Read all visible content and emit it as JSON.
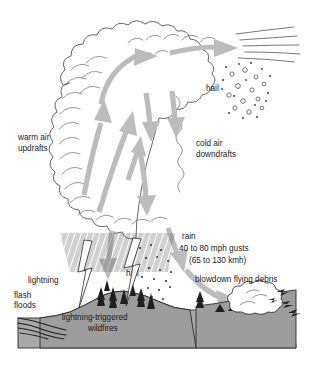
{
  "figure": {
    "background_color": "#ffffff"
  },
  "colors": {
    "arrow": "#bcbcbc",
    "cloud_outline": "#4a4a4a",
    "ground": "#a8a8a8",
    "hill": "#9d9d9d",
    "text": "#1a1a1a",
    "ink": "#2b2b2b"
  },
  "labels": {
    "warm_air_updrafts_line1": "warm air",
    "warm_air_updrafts_line2": "updrafts",
    "cold_air_downdrafts_line1": "cold air",
    "cold_air_downdrafts_line2": "downdrafts",
    "hail_upper": "hail",
    "hail_lower": "hail",
    "rain": "rain",
    "gusts_line1": "40 to 80 mph gusts",
    "gusts_line2": "(65 to 130 kmh)",
    "blowdown": "blowdown flying debris",
    "lightning": "lightning",
    "flash_floods_line1": "flash",
    "flash_floods_line2": "floods",
    "wildfires_line1": "lightning-triggered",
    "wildfires_line2": "wildfires"
  },
  "elements": {
    "cloud": "cumulonimbus-cloud",
    "anvil_outflow": "anvil-wind-lines",
    "updraft_arrows": "updraft-arrows",
    "downdraft_arrows": "downdraft-arrows",
    "anvil_arrows": "anvil-outflow-arrows",
    "rain_shaft": "rain-hatching",
    "hail_shaft_upper": "hail-particles-upper",
    "hail_shaft_lower": "hail-particles-lower",
    "lightning_bolts": "lightning-bolts",
    "trees": "burning-trees",
    "flood_water": "flash-flood-water",
    "dust_cloud": "blowdown-dust-cloud",
    "flying_debris": "flying-debris",
    "ground": "ground-profile"
  }
}
